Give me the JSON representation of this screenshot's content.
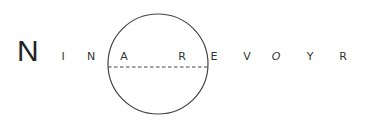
{
  "logo": {
    "initial": "N",
    "letters": [
      {
        "char": "I",
        "x": 63
      },
      {
        "char": "N",
        "x": 91
      },
      {
        "char": "A",
        "x": 124
      },
      {
        "char": "R",
        "x": 182
      },
      {
        "char": "E",
        "x": 214
      },
      {
        "char": "V",
        "x": 247
      },
      {
        "char": "O",
        "x": 276
      },
      {
        "char": "Y",
        "x": 310
      },
      {
        "char": "R",
        "x": 343
      }
    ],
    "full_name": "NINA REVOYR"
  },
  "colors": {
    "stroke": "#444444",
    "text": "#333333",
    "background": "#ffffff"
  }
}
